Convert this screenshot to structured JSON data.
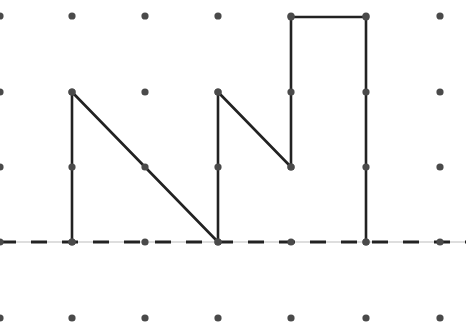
{
  "diagram": {
    "type": "dot-grid-figure",
    "background": "#ffffff",
    "grid": {
      "columns_x": [
        0,
        72,
        145,
        218,
        291,
        366,
        440
      ],
      "rows_y": [
        16,
        92,
        167,
        242,
        318
      ],
      "dot_radius": 3.6,
      "dot_color": "#4a4a4a"
    },
    "figure": {
      "stroke": "#222222",
      "stroke_width": 2.6,
      "points": [
        [
          72,
          242
        ],
        [
          72,
          92
        ],
        [
          218,
          242
        ],
        [
          218,
          92
        ],
        [
          291,
          167
        ],
        [
          291,
          17
        ],
        [
          366,
          17
        ],
        [
          366,
          242
        ]
      ],
      "grid_points": [
        [
          1,
          3
        ],
        [
          1,
          1
        ],
        [
          3,
          3
        ],
        [
          3,
          1
        ],
        [
          4,
          2
        ],
        [
          4,
          0
        ],
        [
          5,
          0
        ],
        [
          5,
          3
        ]
      ]
    },
    "baseline": {
      "y": 242,
      "x_start": 0,
      "x_end": 466,
      "style": "dashed",
      "dash_color": "#222222",
      "dash_width": 3,
      "dash_pattern": [
        16,
        15
      ],
      "thin_line_color": "#bdbdbd"
    }
  }
}
